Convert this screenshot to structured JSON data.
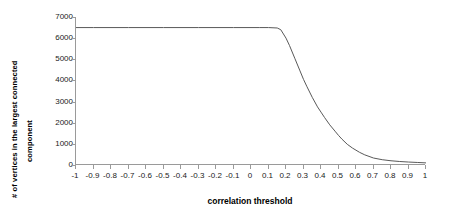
{
  "chart_data": {
    "type": "line",
    "title": "",
    "xlabel": "correlation threshold",
    "ylabel_line1": "# of vertices in the largest connected",
    "ylabel_line2": "component",
    "xlim": [
      -1,
      1
    ],
    "ylim": [
      0,
      7000
    ],
    "grid": false,
    "legend": false,
    "line_color": "#595959",
    "axis_color": "#9a9a9a",
    "xticks": [
      "-1",
      "-0.9",
      "-0.8",
      "-0.7",
      "-0.6",
      "-0.5",
      "-0.4",
      "-0.3",
      "-0.2",
      "-0.1",
      "0",
      "0.1",
      "0.2",
      "0.3",
      "0.4",
      "0.5",
      "0.6",
      "0.7",
      "0.8",
      "0.9",
      "1"
    ],
    "xtick_values": [
      -1,
      -0.9,
      -0.8,
      -0.7,
      -0.6,
      -0.5,
      -0.4,
      -0.3,
      -0.2,
      -0.1,
      0,
      0.1,
      0.2,
      0.3,
      0.4,
      0.5,
      0.6,
      0.7,
      0.8,
      0.9,
      1
    ],
    "yticks": [
      "0",
      "1000",
      "2000",
      "3000",
      "4000",
      "5000",
      "6000",
      "7000"
    ],
    "ytick_values": [
      0,
      1000,
      2000,
      3000,
      4000,
      5000,
      6000,
      7000
    ],
    "x": [
      -1.0,
      -0.9,
      -0.8,
      -0.7,
      -0.6,
      -0.5,
      -0.4,
      -0.3,
      -0.2,
      -0.1,
      0.0,
      0.05,
      0.1,
      0.15,
      0.17,
      0.2,
      0.22,
      0.25,
      0.28,
      0.3,
      0.32,
      0.35,
      0.38,
      0.4,
      0.42,
      0.45,
      0.48,
      0.5,
      0.52,
      0.55,
      0.58,
      0.6,
      0.62,
      0.65,
      0.7,
      0.75,
      0.8,
      0.85,
      0.9,
      0.95,
      1.0
    ],
    "values": [
      6500,
      6500,
      6500,
      6500,
      6500,
      6500,
      6500,
      6500,
      6500,
      6500,
      6500,
      6500,
      6500,
      6480,
      6400,
      6000,
      5650,
      5050,
      4450,
      4050,
      3700,
      3200,
      2750,
      2500,
      2250,
      1900,
      1600,
      1400,
      1220,
      980,
      800,
      700,
      600,
      480,
      330,
      250,
      200,
      165,
      140,
      120,
      100
    ],
    "series": [
      {
        "name": "largest connected component size",
        "values": [
          6500,
          6500,
          6500,
          6500,
          6500,
          6500,
          6500,
          6500,
          6500,
          6500,
          6500,
          6500,
          6500,
          6480,
          6400,
          6000,
          5650,
          5050,
          4450,
          4050,
          3700,
          3200,
          2750,
          2500,
          2250,
          1900,
          1600,
          1400,
          1220,
          980,
          800,
          700,
          600,
          480,
          330,
          250,
          200,
          165,
          140,
          120,
          100
        ]
      }
    ],
    "annotations": {
      "plateau_value": 6500,
      "knee_x": 0.17,
      "tail_flat_from_x": 0.6
    }
  }
}
